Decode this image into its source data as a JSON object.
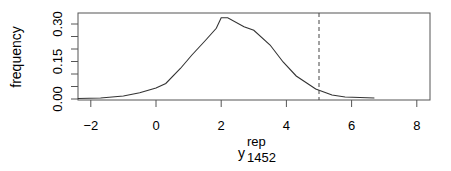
{
  "chart_data": {
    "type": "line",
    "title": "",
    "xlabel": "y_1452^rep",
    "xlabel_parts": {
      "base": "y",
      "sup": "rep",
      "sub": "1452"
    },
    "ylabel": "frequency",
    "xlim": [
      -2.4,
      8.5
    ],
    "ylim": [
      -0.005,
      0.345
    ],
    "x_ticks": [
      -2,
      0,
      2,
      4,
      6,
      8
    ],
    "x_tick_labels": [
      "−2",
      "0",
      "2",
      "4",
      "6",
      "8"
    ],
    "y_ticks": [
      0.0,
      0.05,
      0.1,
      0.15,
      0.2,
      0.25,
      0.3
    ],
    "y_tick_labels": [
      "0.00",
      "",
      "",
      "0.15",
      "",
      "",
      "0.30"
    ],
    "grid": false,
    "legend": null,
    "series": [
      {
        "name": "density of replicated y_1452",
        "style": "solid",
        "x": [
          -2.4,
          -1.7,
          -1.0,
          -0.5,
          0.0,
          0.3,
          0.75,
          1.1,
          1.5,
          1.85,
          2.0,
          2.2,
          2.7,
          3.0,
          3.5,
          3.9,
          4.3,
          4.9,
          5.4,
          5.8,
          6.7
        ],
        "y": [
          0.002,
          0.004,
          0.012,
          0.025,
          0.044,
          0.062,
          0.122,
          0.176,
          0.232,
          0.283,
          0.325,
          0.325,
          0.289,
          0.275,
          0.216,
          0.148,
          0.092,
          0.04,
          0.016,
          0.008,
          0.004
        ]
      }
    ],
    "annotations": [
      {
        "type": "vline",
        "x": 5.0,
        "style": "dashed",
        "label": "observed y_1452"
      }
    ]
  }
}
